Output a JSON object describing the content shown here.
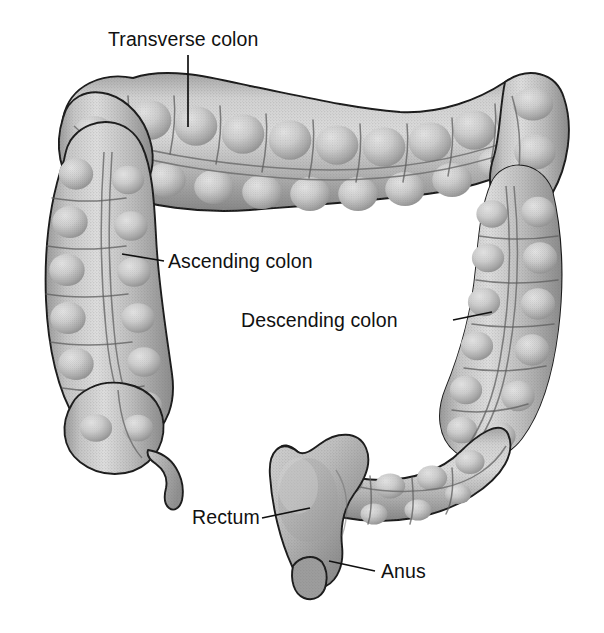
{
  "figure": {
    "background_color": "#ffffff",
    "outline_color": "#1b1b1b",
    "tissue_light": "#d8d8d8",
    "tissue_mid": "#b4b4b4",
    "tissue_dark": "#8a8a8a",
    "tissue_shadow": "#707070",
    "label_color": "#111111"
  },
  "labels": [
    {
      "id": "transverse-colon",
      "text": "Transverse colon",
      "text_x": 108,
      "text_y": 46,
      "anchor": "start",
      "leader": "M 188 55 L 188 127"
    },
    {
      "id": "ascending-colon",
      "text": "Ascending colon",
      "text_x": 168,
      "text_y": 268,
      "anchor": "start",
      "leader": "M 164 261 L 122 254"
    },
    {
      "id": "descending-colon",
      "text": "Descending colon",
      "text_x": 241,
      "text_y": 327,
      "anchor": "start",
      "leader": "M 453 320 L 492 312"
    },
    {
      "id": "rectum",
      "text": "Rectum",
      "text_x": 192,
      "text_y": 524,
      "anchor": "start",
      "leader": "M 262 518 L 310 508"
    },
    {
      "id": "anus",
      "text": "Anus",
      "text_x": 381,
      "text_y": 578,
      "anchor": "start",
      "leader": "M 375 571 L 329 561"
    }
  ],
  "structures": [
    {
      "id": "transverse-colon-body",
      "name": "Transverse colon"
    },
    {
      "id": "hepatic-flexure",
      "name": "Hepatic flexure"
    },
    {
      "id": "splenic-flexure",
      "name": "Splenic flexure"
    },
    {
      "id": "ascending-colon-body",
      "name": "Ascending colon"
    },
    {
      "id": "descending-colon-body",
      "name": "Descending colon"
    },
    {
      "id": "cecum",
      "name": "Cecum"
    },
    {
      "id": "vermiform-appendix",
      "name": "Vermiform appendix"
    },
    {
      "id": "sigmoid-colon",
      "name": "Sigmoid colon"
    },
    {
      "id": "rectum-body",
      "name": "Rectum"
    },
    {
      "id": "anal-canal",
      "name": "Anus"
    }
  ]
}
